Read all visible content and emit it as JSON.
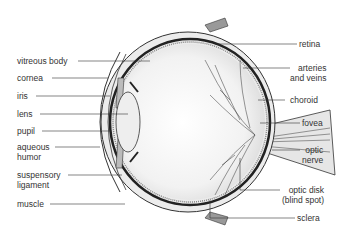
{
  "diagram": {
    "labels_left": [
      {
        "id": "vitreous-body",
        "text": "vitreous body"
      },
      {
        "id": "cornea",
        "text": "cornea"
      },
      {
        "id": "iris",
        "text": "iris"
      },
      {
        "id": "lens",
        "text": "lens"
      },
      {
        "id": "pupil",
        "text": "pupil"
      },
      {
        "id": "aqueous-humor",
        "line1": "aqueous",
        "line2": "humor"
      },
      {
        "id": "suspensory-ligament",
        "line1": "suspensory",
        "line2": "ligament"
      },
      {
        "id": "muscle",
        "text": "muscle"
      }
    ],
    "labels_right": [
      {
        "id": "retina",
        "text": "retina"
      },
      {
        "id": "arteries-and-veins",
        "line1": "arteries",
        "line2": "and veins"
      },
      {
        "id": "choroid",
        "text": "choroid"
      },
      {
        "id": "fovea",
        "text": "fovea"
      },
      {
        "id": "optic-nerve",
        "line1": "optic",
        "line2": "nerve"
      },
      {
        "id": "optic-disk",
        "line1": "optic disk",
        "line2": "(blind spot)"
      },
      {
        "id": "sclera",
        "text": "sclera"
      }
    ],
    "colors": {
      "line": "#333333",
      "fill": "#e8e8e8",
      "dark": "#222222"
    }
  }
}
